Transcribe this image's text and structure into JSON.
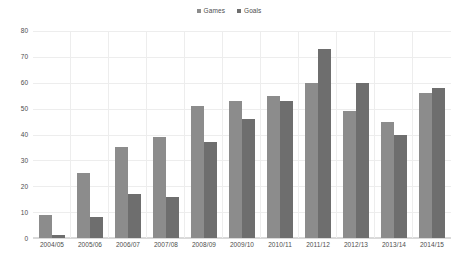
{
  "chart_data": {
    "type": "bar",
    "title": "",
    "subtitle": "",
    "xlabel": "",
    "ylabel": "",
    "ylim": [
      0,
      80
    ],
    "yticks": [
      0,
      10,
      20,
      30,
      40,
      50,
      60,
      70,
      80
    ],
    "grid": true,
    "legend_position": "top-center",
    "categories": [
      "2004/05",
      "2005/06",
      "2006/07",
      "2007/08",
      "2008/09",
      "2009/10",
      "2010/11",
      "2011/12",
      "2012/13",
      "2013/14",
      "2014/15"
    ],
    "series": [
      {
        "name": "Games",
        "color": "#8c8c8c",
        "values": [
          9,
          25,
          35,
          39,
          51,
          53,
          55,
          60,
          49,
          45,
          56
        ]
      },
      {
        "name": "Goals",
        "color": "#6e6e6e",
        "values": [
          1,
          8,
          17,
          16,
          37,
          46,
          53,
          73,
          60,
          40,
          58
        ]
      }
    ]
  },
  "colors": {
    "background": "#ffffff",
    "gridline": "#ededed",
    "axis": "#d9d9d9",
    "text": "#4d4d4d",
    "series_games": "#8c8c8c",
    "series_goals": "#6e6e6e"
  }
}
